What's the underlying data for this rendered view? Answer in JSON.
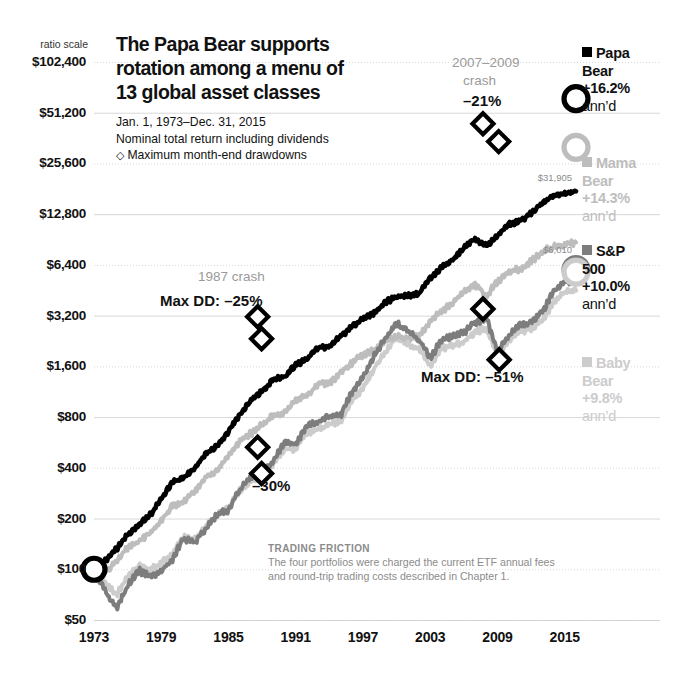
{
  "header": {
    "title_lines": [
      "The Papa Bear supports",
      "rotation among a menu of",
      "13 global asset classes"
    ],
    "subtitle_lines": [
      "Jan. 1, 1973–Dec. 31, 2015",
      "Nominal total return including dividends"
    ],
    "drawdown_note": "Maximum month-end drawdowns",
    "drawdown_glyph": "◇"
  },
  "axis": {
    "ratio_scale_label": "ratio scale",
    "y_ticks": [
      "$102,400",
      "$51,200",
      "$25,600",
      "$12,800",
      "$6,400",
      "$3,200",
      "$1,600",
      "$800",
      "$400",
      "$200",
      "$100",
      "$50"
    ],
    "x_ticks": [
      "1973",
      "1979",
      "1985",
      "1991",
      "1997",
      "2003",
      "2009",
      "2015"
    ]
  },
  "legend": [
    {
      "name": "papa",
      "line1": "Papa",
      "line2": "Bear",
      "line3": "+16.2%",
      "line4": "ann’d",
      "color": "#000000",
      "text_color": "#111111"
    },
    {
      "name": "mama",
      "line1": "Mama",
      "line2": "Bear",
      "line3": "+14.3%",
      "line4": "ann’d",
      "color": "#bdbdbd",
      "text_color": "#bdbdbd"
    },
    {
      "name": "sp500",
      "line1": "S&P",
      "line2": "500",
      "line3": "+10.0%",
      "line4": "ann’d",
      "color": "#7d7d7d",
      "text_color": "#111111"
    },
    {
      "name": "baby",
      "line1": "Baby",
      "line2": "Bear",
      "line3": "+9.8%",
      "line4": "ann’d",
      "color": "#cccccc",
      "text_color": "#cccccc"
    }
  ],
  "end_labels": [
    {
      "name": "mama-end-value",
      "text": "$31,905"
    },
    {
      "name": "sp500-end-value",
      "text": "$6,010"
    }
  ],
  "annotations": [
    {
      "name": "crash-1987-label",
      "text": "1987 crash",
      "style": "gray"
    },
    {
      "name": "papa-maxdd-label",
      "text": "Max DD: –25%",
      "style": "dark"
    },
    {
      "name": "crash-2007-label-line1",
      "text": "2007–2009",
      "style": "gray"
    },
    {
      "name": "crash-2007-label-line2",
      "text": "crash",
      "style": "gray"
    },
    {
      "name": "papa-2007-dd-label",
      "text": "–21%",
      "style": "dark"
    },
    {
      "name": "sp500-1987-dd-label",
      "text": "–30%",
      "style": "dark"
    },
    {
      "name": "sp500-maxdd-label",
      "text": "Max DD: –51%",
      "style": "dark"
    }
  ],
  "footnote": {
    "heading": "TRADING FRICTION",
    "body_lines": [
      "The four portfolios were charged the current ETF annual fees",
      "and round-trip trading costs described in Chapter 1."
    ]
  },
  "chart_data": {
    "type": "line",
    "title": "The Papa Bear supports rotation among a menu of 13 global asset classes",
    "subtitle": "Jan. 1, 1973–Dec. 31, 2015 — Nominal total return including dividends",
    "xlabel": "",
    "ylabel": "Growth of $100 (ratio scale)",
    "yscale": "log",
    "ylim": [
      50,
      102400
    ],
    "xlim": [
      1973,
      2016
    ],
    "grid": true,
    "legend_position": "right",
    "y_tick_values": [
      102400,
      51200,
      25600,
      12800,
      6400,
      3200,
      1600,
      800,
      400,
      200,
      100,
      50
    ],
    "x_tick_values": [
      1973,
      1979,
      1985,
      1991,
      1997,
      2003,
      2009,
      2015
    ],
    "series": [
      {
        "name": "Papa Bear",
        "color": "#000000",
        "cagr_pct": 16.2,
        "start_value": 100,
        "end_value": 62000,
        "max_drawdown_pct": -25,
        "x": [
          1973,
          1974,
          1975,
          1976,
          1977,
          1978,
          1979,
          1980,
          1981,
          1982,
          1983,
          1984,
          1985,
          1986,
          1987,
          1988,
          1989,
          1990,
          1991,
          1992,
          1993,
          1994,
          1995,
          1996,
          1997,
          1998,
          1999,
          2000,
          2001,
          2002,
          2003,
          2004,
          2005,
          2006,
          2007,
          2008,
          2009,
          2010,
          2011,
          2012,
          2013,
          2014,
          2015,
          2016
        ],
        "y": [
          100,
          112,
          132,
          160,
          182,
          210,
          260,
          330,
          350,
          400,
          490,
          540,
          660,
          830,
          1000,
          1150,
          1330,
          1390,
          1640,
          1760,
          2070,
          2090,
          2420,
          2750,
          3060,
          3300,
          3850,
          4150,
          4200,
          4350,
          5350,
          6150,
          6900,
          8100,
          9100,
          8300,
          9600,
          11200,
          11600,
          13000,
          15000,
          16500,
          17000,
          17500
        ]
      },
      {
        "name": "Mama Bear",
        "color": "#bdbdbd",
        "cagr_pct": 14.3,
        "start_value": 100,
        "end_value": 31905,
        "x": [
          1973,
          1974,
          1975,
          1976,
          1977,
          1978,
          1979,
          1980,
          1981,
          1982,
          1983,
          1984,
          1985,
          1986,
          1987,
          1988,
          1989,
          1990,
          1991,
          1992,
          1993,
          1994,
          1995,
          1996,
          1997,
          1998,
          1999,
          2000,
          2001,
          2002,
          2003,
          2004,
          2005,
          2006,
          2007,
          2008,
          2009,
          2010,
          2011,
          2012,
          2013,
          2014,
          2015,
          2016
        ],
        "y": [
          100,
          95,
          112,
          134,
          146,
          163,
          195,
          240,
          250,
          290,
          350,
          385,
          470,
          580,
          640,
          720,
          830,
          840,
          1000,
          1070,
          1270,
          1270,
          1470,
          1680,
          1870,
          2000,
          2300,
          2400,
          2350,
          2400,
          2950,
          3400,
          3800,
          4450,
          4900,
          4200,
          5100,
          5900,
          6000,
          6700,
          7700,
          8200,
          8400,
          8700
        ]
      },
      {
        "name": "S&P 500",
        "color": "#7d7d7d",
        "cagr_pct": 10.0,
        "start_value": 100,
        "end_value": 6010,
        "max_drawdown_pct": -51,
        "x": [
          1973,
          1974,
          1975,
          1976,
          1977,
          1978,
          1979,
          1980,
          1981,
          1982,
          1983,
          1984,
          1985,
          1986,
          1987,
          1988,
          1989,
          1990,
          1991,
          1992,
          1993,
          1994,
          1995,
          1996,
          1997,
          1998,
          1999,
          2000,
          2001,
          2002,
          2003,
          2004,
          2005,
          2006,
          2007,
          2008,
          2009,
          2010,
          2011,
          2012,
          2013,
          2014,
          2015,
          2016
        ],
        "y": [
          100,
          74,
          58,
          80,
          98,
          91,
          97,
          115,
          152,
          144,
          175,
          212,
          225,
          297,
          352,
          372,
          433,
          570,
          552,
          718,
          750,
          808,
          818,
          1125,
          1383,
          1845,
          2370,
          2867,
          2608,
          2298,
          1790,
          2300,
          2415,
          2530,
          2930,
          3095,
          1950,
          2465,
          2835,
          2895,
          3360,
          4445,
          5055,
          5120
        ]
      },
      {
        "name": "Baby Bear",
        "color": "#cccccc",
        "cagr_pct": 9.8,
        "start_value": 100,
        "end_value": 5800,
        "x": [
          1973,
          1974,
          1975,
          1976,
          1977,
          1978,
          1979,
          1980,
          1981,
          1982,
          1983,
          1984,
          1985,
          1986,
          1987,
          1988,
          1989,
          1990,
          1991,
          1992,
          1993,
          1994,
          1995,
          1996,
          1997,
          1998,
          1999,
          2000,
          2001,
          2002,
          2003,
          2004,
          2005,
          2006,
          2007,
          2008,
          2009,
          2010,
          2011,
          2012,
          2013,
          2014,
          2015,
          2016
        ],
        "y": [
          100,
          84,
          70,
          90,
          105,
          100,
          108,
          125,
          155,
          150,
          180,
          212,
          232,
          290,
          335,
          360,
          415,
          520,
          510,
          650,
          680,
          730,
          750,
          995,
          1200,
          1560,
          1960,
          2360,
          2200,
          2000,
          1620,
          2030,
          2140,
          2250,
          2560,
          2690,
          1850,
          2270,
          2580,
          2660,
          3020,
          3840,
          4400,
          4500
        ]
      }
    ],
    "markers": [
      {
        "series": "Papa Bear",
        "name": "papa-dd-1987-peak",
        "x": 1987.6,
        "y": 3150
      },
      {
        "series": "Papa Bear",
        "name": "papa-dd-1987-trough",
        "x": 1987.95,
        "y": 2330
      },
      {
        "series": "Papa Bear",
        "name": "papa-dd-2008-peak",
        "x": 2007.7,
        "y": 44000
      },
      {
        "series": "Papa Bear",
        "name": "papa-dd-2008-trough",
        "x": 2009.1,
        "y": 34500
      },
      {
        "series": "S&P 500",
        "name": "sp500-dd-1987-peak",
        "x": 1987.6,
        "y": 530
      },
      {
        "series": "S&P 500",
        "name": "sp500-dd-1987-trough",
        "x": 1987.95,
        "y": 370
      },
      {
        "series": "S&P 500",
        "name": "sp500-dd-2007-peak",
        "x": 2007.7,
        "y": 3500
      },
      {
        "series": "S&P 500",
        "name": "sp500-dd-2009-trough",
        "x": 2009.15,
        "y": 1750
      }
    ],
    "endpoint_markers": [
      {
        "series": "Papa Bear",
        "x": 1973,
        "y": 100
      },
      {
        "series": "Papa Bear",
        "x": 2016,
        "y": 62000
      },
      {
        "series": "Mama Bear",
        "x": 2016,
        "y": 31905
      },
      {
        "series": "S&P 500",
        "x": 2016,
        "y": 6010
      },
      {
        "series": "Baby Bear",
        "x": 2016,
        "y": 5800
      }
    ]
  }
}
